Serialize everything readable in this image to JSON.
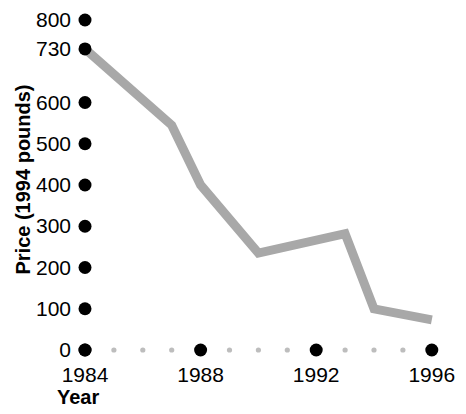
{
  "chart_data": {
    "type": "line",
    "title": "",
    "xlabel": "Year",
    "ylabel": "Price (1994 pounds)",
    "xlim": [
      1984,
      1996.5
    ],
    "ylim": [
      0,
      800
    ],
    "grid": false,
    "legend": null,
    "line_color": "#a8a8a8",
    "marker_color": "#000000",
    "x": [
      1984,
      1987,
      1988,
      1990,
      1993,
      1994,
      1996
    ],
    "values": [
      730,
      545,
      400,
      235,
      282,
      100,
      73
    ],
    "series": [
      {
        "name": "Price",
        "points": [
          {
            "x": 1984,
            "y": 730
          },
          {
            "x": 1987,
            "y": 545
          },
          {
            "x": 1988,
            "y": 400
          },
          {
            "x": 1990,
            "y": 235
          },
          {
            "x": 1993,
            "y": 282
          },
          {
            "x": 1994,
            "y": 100
          },
          {
            "x": 1996,
            "y": 73
          }
        ]
      }
    ],
    "ytick_labels": [
      "800",
      "730",
      "600",
      "500",
      "400",
      "300",
      "200",
      "100",
      "0"
    ],
    "ytick_values": [
      800,
      730,
      600,
      500,
      400,
      300,
      200,
      100,
      0
    ],
    "xtick_labels": [
      "1984",
      "1988",
      "1992",
      "1996"
    ],
    "xtick_values": [
      1984,
      1988,
      1992,
      1996
    ],
    "xminor_values": [
      1985,
      1986,
      1987,
      1989,
      1990,
      1991,
      1993,
      1994,
      1995
    ],
    "major_tick_marker": "filled-circle",
    "minor_tick_marker": "small-dot"
  },
  "axes": {
    "y_title": "Price (1994 pounds)",
    "x_title": "Year"
  }
}
